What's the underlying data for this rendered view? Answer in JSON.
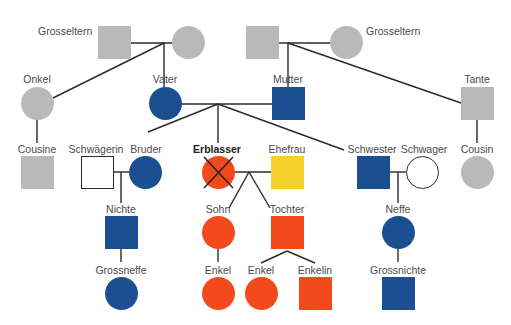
{
  "colors": {
    "grey": "#b9b9b9",
    "blue": "#1c4f92",
    "orange": "#f24a1c",
    "yellow": "#f6d12b",
    "outline": "#2a2a2a",
    "line": "#2a2a2a"
  },
  "nodes": {
    "gp_left_m": {
      "label": "Grosseltern",
      "shape": "square",
      "color": "grey"
    },
    "gp_left_f": {
      "label": "",
      "shape": "circle",
      "color": "grey"
    },
    "gp_right_m": {
      "label": "",
      "shape": "square",
      "color": "grey"
    },
    "gp_right_f": {
      "label": "Grosseltern",
      "shape": "circle",
      "color": "grey"
    },
    "onkel": {
      "label": "Onkel",
      "shape": "circle",
      "color": "grey"
    },
    "vater": {
      "label": "Vater",
      "shape": "circle",
      "color": "blue"
    },
    "mutter": {
      "label": "Mutter",
      "shape": "square",
      "color": "blue"
    },
    "tante": {
      "label": "Tante",
      "shape": "square",
      "color": "grey"
    },
    "cousine": {
      "label": "Cousine",
      "shape": "square",
      "color": "grey"
    },
    "schwaegerin": {
      "label": "Schwägerin",
      "shape": "square",
      "color": "outline"
    },
    "bruder": {
      "label": "Bruder",
      "shape": "circle",
      "color": "blue"
    },
    "erblasser": {
      "label": "Erblasser",
      "shape": "circle",
      "color": "orange",
      "crossed": true
    },
    "ehefrau": {
      "label": "Ehefrau",
      "shape": "square",
      "color": "yellow"
    },
    "schwester": {
      "label": "Schwester",
      "shape": "square",
      "color": "blue"
    },
    "schwager": {
      "label": "Schwager",
      "shape": "circle",
      "color": "outline"
    },
    "cousin": {
      "label": "Cousin",
      "shape": "circle",
      "color": "grey"
    },
    "nichte": {
      "label": "Nichte",
      "shape": "square",
      "color": "blue"
    },
    "sohn": {
      "label": "Sohn",
      "shape": "circle",
      "color": "orange"
    },
    "tochter": {
      "label": "Tochter",
      "shape": "square",
      "color": "orange"
    },
    "neffe": {
      "label": "Neffe",
      "shape": "circle",
      "color": "blue"
    },
    "grossneffe": {
      "label": "Grossneffe",
      "shape": "circle",
      "color": "blue"
    },
    "enkel1": {
      "label": "Enkel",
      "shape": "circle",
      "color": "orange"
    },
    "enkel2": {
      "label": "Enkel",
      "shape": "circle",
      "color": "orange"
    },
    "enkelin": {
      "label": "Enkelin",
      "shape": "square",
      "color": "orange"
    },
    "grossnichte": {
      "label": "Grossnichte",
      "shape": "square",
      "color": "blue"
    }
  }
}
